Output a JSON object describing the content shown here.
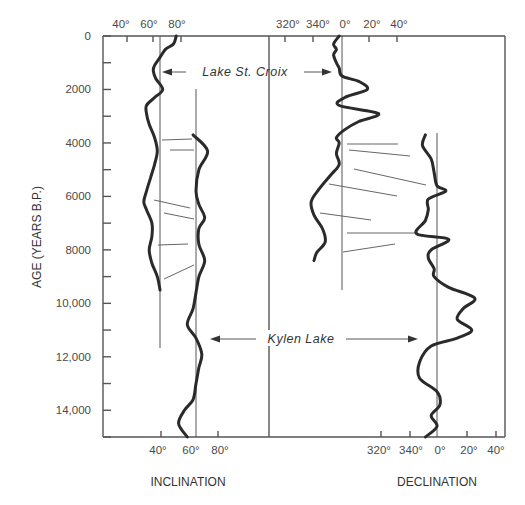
{
  "chart_data": {
    "type": "line",
    "title": "",
    "ylabel": "AGE (YEARS B.P.)",
    "ylim": [
      0,
      15000
    ],
    "y_ticks": [
      "0",
      "2000",
      "4000",
      "6000",
      "8000",
      "10,000",
      "12,000",
      "14,000"
    ],
    "y_tick_values": [
      0,
      2000,
      4000,
      6000,
      8000,
      10000,
      12000,
      14000
    ],
    "panels": [
      {
        "name": "inclination",
        "xlabel": "INCLINATION",
        "top_ticks": [
          "40°",
          "60°",
          "80°"
        ],
        "bottom_ticks": [
          "40°",
          "60°",
          "80°"
        ],
        "series": [
          {
            "name": "Lake St. Croix",
            "age_range": [
              0,
              9500
            ],
            "reference": "60°",
            "points": [
              [
                0,
                72
              ],
              [
                300,
                70
              ],
              [
                500,
                64
              ],
              [
                800,
                60
              ],
              [
                1100,
                56
              ],
              [
                1300,
                55
              ],
              [
                1600,
                57
              ],
              [
                2000,
                62
              ],
              [
                2300,
                56
              ],
              [
                2600,
                50
              ],
              [
                2900,
                50
              ],
              [
                3300,
                52
              ],
              [
                3800,
                56
              ],
              [
                4300,
                58
              ],
              [
                4800,
                56
              ],
              [
                5300,
                53
              ],
              [
                5800,
                50
              ],
              [
                6200,
                48
              ],
              [
                6500,
                50
              ],
              [
                7000,
                54
              ],
              [
                7500,
                54
              ],
              [
                8000,
                52
              ],
              [
                8500,
                54
              ],
              [
                9000,
                58
              ],
              [
                9500,
                60
              ]
            ]
          },
          {
            "name": "Kylen Lake",
            "age_range": [
              3700,
              15000
            ],
            "reference": "60°",
            "points": [
              [
                3700,
                58
              ],
              [
                4300,
                68
              ],
              [
                5000,
                62
              ],
              [
                5800,
                60
              ],
              [
                6300,
                62
              ],
              [
                6800,
                66
              ],
              [
                7200,
                62
              ],
              [
                7800,
                62
              ],
              [
                8400,
                66
              ],
              [
                9000,
                62
              ],
              [
                9600,
                60
              ],
              [
                10200,
                58
              ],
              [
                10800,
                54
              ],
              [
                11300,
                60
              ],
              [
                11900,
                64
              ],
              [
                12400,
                62
              ],
              [
                13000,
                60
              ],
              [
                13600,
                58
              ],
              [
                14000,
                52
              ],
              [
                14500,
                48
              ],
              [
                15000,
                54
              ]
            ]
          }
        ]
      },
      {
        "name": "declination",
        "xlabel": "DECLINATION",
        "top_ticks": [
          "320°",
          "340°",
          "0°",
          "20°",
          "40°"
        ],
        "bottom_ticks": [
          "320°",
          "340°",
          "0°",
          "20°",
          "40°"
        ],
        "series": [
          {
            "name": "Lake St. Croix",
            "age_range": [
              0,
              8400
            ],
            "reference": "0°",
            "points": [
              [
                0,
                -2
              ],
              [
                300,
                -6
              ],
              [
                500,
                -4
              ],
              [
                700,
                -6
              ],
              [
                1000,
                -4
              ],
              [
                1200,
                -2
              ],
              [
                1500,
                0
              ],
              [
                1700,
                12
              ],
              [
                2000,
                18
              ],
              [
                2300,
                2
              ],
              [
                2600,
                -2
              ],
              [
                2900,
                26
              ],
              [
                3200,
                12
              ],
              [
                3500,
                2
              ],
              [
                3800,
                -4
              ],
              [
                4000,
                -2
              ],
              [
                4400,
                -4
              ],
              [
                4800,
                -2
              ],
              [
                5200,
                -8
              ],
              [
                5700,
                -16
              ],
              [
                6200,
                -22
              ],
              [
                6700,
                -20
              ],
              [
                7200,
                -14
              ],
              [
                7700,
                -12
              ],
              [
                8100,
                -18
              ],
              [
                8400,
                -20
              ]
            ]
          },
          {
            "name": "Kylen Lake",
            "age_range": [
              3700,
              15000
            ],
            "reference": "0°",
            "points": [
              [
                3700,
                -8
              ],
              [
                4100,
                -10
              ],
              [
                4600,
                -4
              ],
              [
                5100,
                -2
              ],
              [
                5600,
                0
              ],
              [
                5800,
                6
              ],
              [
                6100,
                -6
              ],
              [
                6500,
                -6
              ],
              [
                6900,
                -8
              ],
              [
                7400,
                -14
              ],
              [
                7600,
                8
              ],
              [
                8000,
                -4
              ],
              [
                8300,
                -6
              ],
              [
                8700,
                -2
              ],
              [
                9000,
                -2
              ],
              [
                9400,
                8
              ],
              [
                9800,
                26
              ],
              [
                10200,
                18
              ],
              [
                10600,
                14
              ],
              [
                11000,
                24
              ],
              [
                11300,
                14
              ],
              [
                11600,
                -4
              ],
              [
                12200,
                -12
              ],
              [
                12800,
                -12
              ],
              [
                13300,
                0
              ],
              [
                13800,
                2
              ],
              [
                14200,
                -4
              ],
              [
                14600,
                0
              ],
              [
                15000,
                -8
              ]
            ]
          }
        ]
      }
    ],
    "annotations": [
      "Lake St. Croix",
      "Kylen Lake"
    ],
    "grid": false,
    "legend": "none"
  },
  "labels": {
    "ylabel": "AGE (YEARS B.P.)",
    "inclination": "INCLINATION",
    "declination": "DECLINATION",
    "lake_st_croix": "Lake St. Croix",
    "kylen_lake": "Kylen Lake",
    "y_ticks": [
      "0",
      "2000",
      "4000",
      "6000",
      "8000",
      "10,000",
      "12,000",
      "14,000"
    ],
    "inc_top_ticks": [
      "40°",
      "60°",
      "80°"
    ],
    "inc_bottom_ticks": [
      "40°",
      "60°",
      "80°"
    ],
    "dec_top_ticks": [
      "320°",
      "340°",
      "0°",
      "20°",
      "40°"
    ],
    "dec_bottom_ticks": [
      "320°",
      "340°",
      "0°",
      "20°",
      "40°"
    ]
  }
}
